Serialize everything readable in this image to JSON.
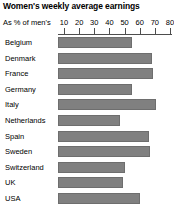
{
  "chart_data": {
    "type": "bar",
    "orientation": "horizontal",
    "title": "Women's weekly average earnings",
    "xlabel": "As % of men's",
    "ylabel": "",
    "categories": [
      "Belgium",
      "Denmark",
      "France",
      "Germany",
      "Italy",
      "Netherlands",
      "Spain",
      "Sweden",
      "Switzerland",
      "UK",
      "USA"
    ],
    "values": [
      55,
      68,
      69,
      55,
      71,
      47,
      66,
      67,
      50,
      49,
      60
    ],
    "xticks": [
      10,
      20,
      30,
      40,
      50,
      60,
      70,
      80
    ],
    "xlim": [
      0,
      80
    ],
    "grid": false,
    "legend": false,
    "bar_color": "#808080",
    "axis_color": "#4d4d4d",
    "background": "#ffffff"
  }
}
